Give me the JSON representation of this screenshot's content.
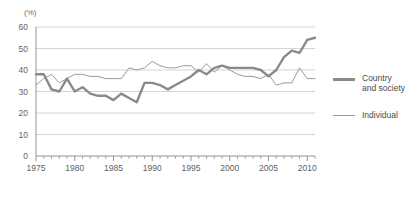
{
  "chart_data": {
    "type": "line",
    "title": "",
    "subtitle": "",
    "xlabel": "",
    "ylabel": "(%)",
    "unit_label": "(%)",
    "xlim": [
      1975,
      2011
    ],
    "ylim": [
      0,
      60
    ],
    "yticks": [
      0,
      10,
      20,
      30,
      40,
      50,
      60
    ],
    "xticks": [
      1975,
      1980,
      1985,
      1990,
      1995,
      2000,
      2005,
      2010
    ],
    "xtick_labels": [
      "1975",
      "1980",
      "1985",
      "1990",
      "1995",
      "2000",
      "2005",
      "2010"
    ],
    "ytick_labels": [
      "0",
      "10",
      "20",
      "30",
      "40",
      "50",
      "60"
    ],
    "grid": true,
    "grid_axis": "y",
    "legend_position": "right",
    "x": [
      1975,
      1976,
      1977,
      1978,
      1979,
      1980,
      1981,
      1982,
      1983,
      1984,
      1985,
      1986,
      1987,
      1988,
      1989,
      1990,
      1991,
      1992,
      1993,
      1994,
      1995,
      1996,
      1997,
      1998,
      1999,
      2000,
      2001,
      2002,
      2003,
      2004,
      2005,
      2006,
      2007,
      2008,
      2009,
      2010,
      2011
    ],
    "series": [
      {
        "name": "Country and society",
        "color": "#8a8a8a",
        "width": "thick",
        "values": [
          38,
          38,
          31,
          30,
          36,
          30,
          32,
          29,
          28,
          28,
          26,
          29,
          27,
          25,
          34,
          34,
          33,
          31,
          33,
          35,
          37,
          40,
          38,
          41,
          42,
          41,
          41,
          41,
          41,
          40,
          37,
          40,
          46,
          49,
          48,
          54,
          55
        ]
      },
      {
        "name": "Individual",
        "color": "#9a9a9a",
        "width": "thin",
        "values": [
          33,
          36,
          38,
          34,
          36,
          38,
          38,
          37,
          37,
          36,
          36,
          36,
          41,
          40,
          41,
          44,
          42,
          41,
          41,
          42,
          42,
          39,
          43,
          39,
          42,
          40,
          38,
          37,
          37,
          36,
          38,
          33,
          34,
          34,
          41,
          36,
          36
        ]
      }
    ]
  },
  "legend": {
    "items": [
      {
        "label": "Country\nand society",
        "style": "thick"
      },
      {
        "label": "Individual",
        "style": "thin"
      }
    ]
  }
}
